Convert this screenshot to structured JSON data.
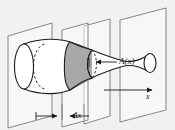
{
  "figure": {
    "type": "solid-of-revolution-cross-section-diagram",
    "background_color": "#f2f1ef",
    "ink_color": "#1a1a1a",
    "plane_edge_color": "#6b6b6b",
    "cross_section_fill": "#a8a8a8",
    "labels": {
      "area_function": "A(x)",
      "delta_x": "Δx",
      "axis": "x"
    },
    "elements": {
      "planes_count": 4,
      "shaded_slab": "cross-section",
      "axis_arrow": "x-axis-arrow",
      "width_marker": "delta-x-dimension-arrows"
    }
  }
}
